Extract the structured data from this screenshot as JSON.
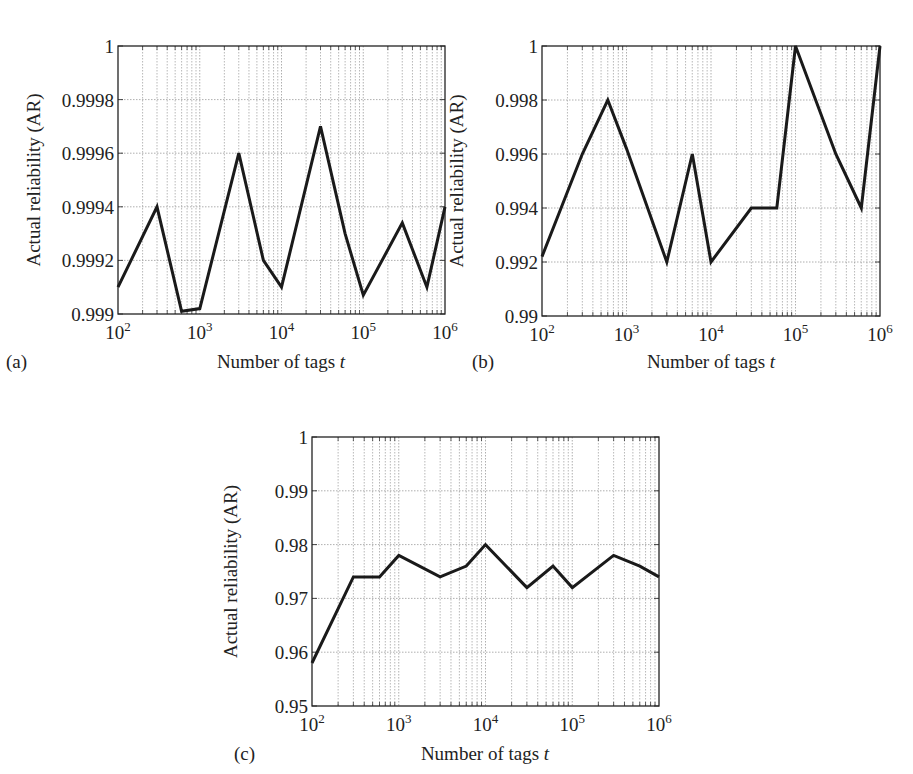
{
  "figure": {
    "panels": [
      "a",
      "b",
      "c"
    ]
  },
  "chart_data": [
    {
      "type": "line",
      "panel_label": "(a)",
      "title": "",
      "xlabel": "Number of tags t",
      "ylabel": "Actual reliability (AR)",
      "xscale": "log",
      "xlim": [
        100,
        1000000
      ],
      "ylim": [
        0.999,
        1.0
      ],
      "xticks": [
        "10^2",
        "10^3",
        "10^4",
        "10^5",
        "10^6"
      ],
      "yticks": [
        "0.999",
        "0.9992",
        "0.9994",
        "0.9996",
        "0.9998",
        "1"
      ],
      "ytick_values": [
        0.999,
        0.9992,
        0.9994,
        0.9996,
        0.9998,
        1.0
      ],
      "grid": true,
      "legend": null,
      "x": [
        100,
        300,
        600,
        1000,
        3000,
        6000,
        10000,
        30000,
        60000,
        100000,
        300000,
        600000,
        1000000
      ],
      "values": [
        0.9991,
        0.9994,
        0.99901,
        0.99902,
        0.9996,
        0.9992,
        0.9991,
        0.9997,
        0.9993,
        0.99907,
        0.99934,
        0.9991,
        0.9994
      ]
    },
    {
      "type": "line",
      "panel_label": "(b)",
      "title": "",
      "xlabel": "Number of tags t",
      "ylabel": "Actual reliability (AR)",
      "xscale": "log",
      "xlim": [
        100,
        1000000
      ],
      "ylim": [
        0.99,
        1.0
      ],
      "xticks": [
        "10^2",
        "10^3",
        "10^4",
        "10^5",
        "10^6"
      ],
      "yticks": [
        "0.99",
        "0.992",
        "0.994",
        "0.996",
        "0.998",
        "1"
      ],
      "ytick_values": [
        0.99,
        0.992,
        0.994,
        0.996,
        0.998,
        1.0
      ],
      "grid": true,
      "legend": null,
      "x": [
        100,
        300,
        600,
        1000,
        3000,
        6000,
        10000,
        30000,
        60000,
        100000,
        300000,
        600000,
        1000000
      ],
      "values": [
        0.9922,
        0.996,
        0.998,
        0.9962,
        0.992,
        0.996,
        0.992,
        0.994,
        0.994,
        1.0,
        0.996,
        0.994,
        1.0
      ]
    },
    {
      "type": "line",
      "panel_label": "(c)",
      "title": "",
      "xlabel": "Number of tags t",
      "ylabel": "Actual reliability (AR)",
      "xscale": "log",
      "xlim": [
        100,
        1000000
      ],
      "ylim": [
        0.95,
        1.0
      ],
      "xticks": [
        "10^2",
        "10^3",
        "10^4",
        "10^5",
        "10^6"
      ],
      "yticks": [
        "0.95",
        "0.96",
        "0.97",
        "0.98",
        "0.99",
        "1"
      ],
      "ytick_values": [
        0.95,
        0.96,
        0.97,
        0.98,
        0.99,
        1.0
      ],
      "grid": true,
      "legend": null,
      "x": [
        100,
        300,
        600,
        1000,
        3000,
        6000,
        10000,
        30000,
        60000,
        100000,
        300000,
        600000,
        1000000
      ],
      "values": [
        0.958,
        0.974,
        0.974,
        0.978,
        0.974,
        0.976,
        0.98,
        0.972,
        0.976,
        0.972,
        0.978,
        0.976,
        0.974
      ]
    }
  ],
  "layout": {
    "panels": [
      {
        "left": 118,
        "right": 445,
        "top": 46,
        "bottom": 314,
        "label_x": 6,
        "label_y": 368,
        "xlabel_x": 281,
        "xlabel_y": 368,
        "ylabel_x": 40
      },
      {
        "left": 542,
        "right": 880,
        "top": 46,
        "bottom": 316,
        "label_x": 472,
        "label_y": 368,
        "xlabel_x": 711,
        "xlabel_y": 368,
        "ylabel_x": 463
      },
      {
        "left": 312,
        "right": 659,
        "top": 437,
        "bottom": 706,
        "label_x": 234,
        "label_y": 760,
        "xlabel_x": 485,
        "xlabel_y": 760,
        "ylabel_x": 237
      }
    ],
    "line_color": "#1a1a1a",
    "grid_color": "#9a9a9a"
  }
}
